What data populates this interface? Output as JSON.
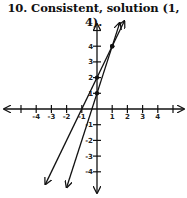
{
  "title": "10. Consistent, solution (1, 4).",
  "chart_data": {
    "type": "line",
    "title": "10. Consistent, solution (1, 4).",
    "xlabel": "",
    "ylabel": "",
    "xlim": [
      -5.5,
      5.5
    ],
    "ylim": [
      -5.3,
      5.8
    ],
    "x_ticks": [
      -4,
      -3,
      -2,
      -1,
      1,
      2,
      3,
      4
    ],
    "y_ticks": [
      -4,
      -3,
      -2,
      -1,
      1,
      2,
      3,
      4
    ],
    "grid": false,
    "series": [
      {
        "name": "y = 2x + 2",
        "points": [
          [
            -3.4,
            -4.8
          ],
          [
            0,
            2
          ],
          [
            1,
            4
          ],
          [
            1.8,
            5.6
          ]
        ],
        "marked": [
          [
            0,
            2
          ],
          [
            1,
            4
          ]
        ]
      },
      {
        "name": "y = 3x + 1",
        "points": [
          [
            -2,
            -5
          ],
          [
            0,
            1
          ],
          [
            1,
            4
          ],
          [
            1.5,
            5.5
          ]
        ],
        "marked": [
          [
            0,
            1
          ],
          [
            1,
            4
          ]
        ]
      }
    ],
    "annotations": [
      {
        "text": "solution (1, 4)",
        "x": 1,
        "y": 4
      }
    ]
  }
}
